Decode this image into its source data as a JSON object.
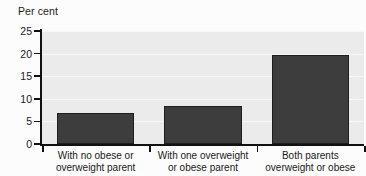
{
  "chart_data": {
    "type": "bar",
    "title": "",
    "subtitle": "",
    "xlabel": "",
    "ylabel": "Per cent",
    "ylim": [
      0,
      25
    ],
    "yticks": [
      0,
      5,
      10,
      15,
      20,
      25
    ],
    "ytick_labels": [
      "0",
      "5",
      "10",
      "15",
      "20",
      "25"
    ],
    "grid": true,
    "legend": false,
    "legend_position": "none",
    "categories": [
      "With no obese or overweight parent",
      "With one overweight or obese parent",
      "Both parents overweight or obese"
    ],
    "category_lines": [
      [
        "With no obese or",
        "overweight parent"
      ],
      [
        "With one overweight",
        "or obese parent"
      ],
      [
        "Both parents",
        "overweight or obese"
      ]
    ],
    "values": [
      6.8,
      8.5,
      19.7
    ],
    "series": [
      {
        "name": "Per cent of children",
        "values": [
          6.8,
          8.5,
          19.7
        ]
      }
    ],
    "colors": {
      "bar_fill": "#3d3d3d",
      "bar_border": "#1e1e1e",
      "plot_background": "#ebebeb",
      "gridline": "#f7f7f7",
      "axis": "#111111",
      "text": "#1a1a1a",
      "page_background": "#fcfcfc"
    }
  }
}
